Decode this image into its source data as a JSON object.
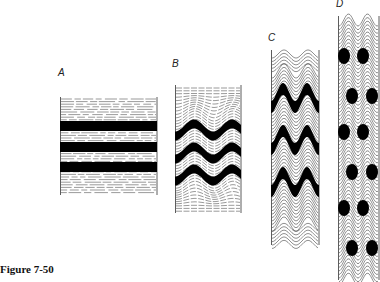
{
  "caption": "Figure 7-50",
  "panels": [
    {
      "label": "A",
      "description": "horizontal layers, undeformed",
      "competent_layers": 3
    },
    {
      "label": "B",
      "description": "gentle sinusoidal folding",
      "competent_layers": 3
    },
    {
      "label": "C",
      "description": "tight folding with shortening",
      "competent_layers": 3
    },
    {
      "label": "D",
      "description": "extreme shortening, boudinaged fold hinges",
      "competent_layers": 3
    }
  ]
}
